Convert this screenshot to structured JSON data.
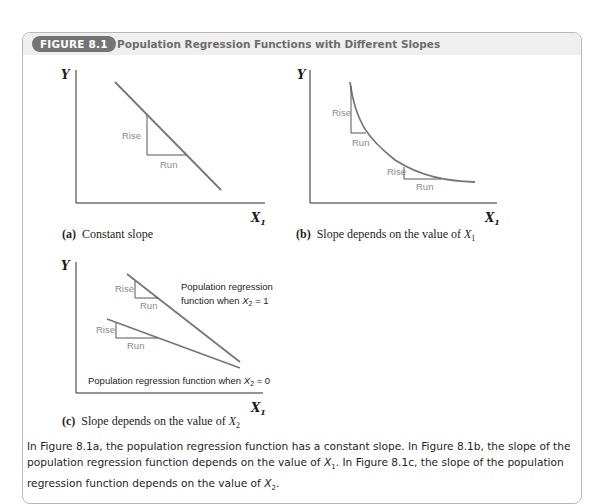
{
  "figure": {
    "badge": "FIGURE 8.1",
    "title": "Population Regression Functions with Different Slopes"
  },
  "panels": {
    "a": {
      "tag": "(a)",
      "caption": "Constant slope",
      "y_label": "Y",
      "x_label": "X",
      "x_sub": "1",
      "rise_label": "Rise",
      "run_label": "Run"
    },
    "b": {
      "tag": "(b)",
      "caption": "Slope depends on the value of ",
      "caption_var": "X",
      "caption_sub": "1",
      "y_label": "Y",
      "x_label": "X",
      "x_sub": "1",
      "rise_label_1": "Rise",
      "run_label_1": "Run",
      "rise_label_2": "Rise",
      "run_label_2": "Run"
    },
    "c": {
      "tag": "(c)",
      "caption": "Slope depends on the value of ",
      "caption_var": "X",
      "caption_sub": "2",
      "y_label": "Y",
      "x_label": "X",
      "x_sub": "1",
      "rise_label_1": "Rise",
      "run_label_1": "Run",
      "rise_label_2": "Rise",
      "run_label_2": "Run",
      "upper_line_label_l1": "Population regression",
      "upper_line_label_l2": "function when ",
      "upper_line_var": "X",
      "upper_line_sub": "2",
      "upper_line_eq": " = 1",
      "lower_line_label": "Population regression function when ",
      "lower_line_var": "X",
      "lower_line_sub": "2",
      "lower_line_eq": " = 0"
    }
  },
  "description": {
    "p1": "In Figure 8.1a, the population regression function has a constant slope. In Figure 8.1b, the slope of the population regression function depends on the value of ",
    "v1": "X",
    "s1": "1",
    "p2": ". In Figure 8.1c, the slope of the population regression function depends on the value of ",
    "v2": "X",
    "s2": "2",
    "p3": "."
  },
  "colors": {
    "badge_bg": "#747474",
    "header_bg": "#efefef",
    "curve": "#777777",
    "axis": "#2a2a2a",
    "rise_run_text": "#8a8a8a"
  }
}
